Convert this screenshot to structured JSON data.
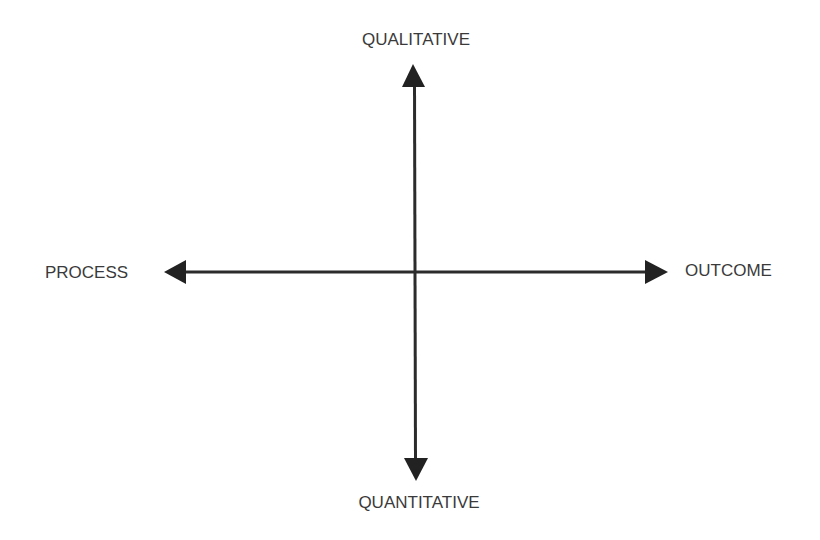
{
  "diagram": {
    "type": "quadrant-axes",
    "colors": {
      "background": "#ffffff",
      "axis": "#2b2b2b",
      "label": "#3a3a3a"
    },
    "axes": {
      "vertical": {
        "top_label": "QUALITATIVE",
        "bottom_label": "QUANTITATIVE"
      },
      "horizontal": {
        "left_label": "PROCESS",
        "right_label": "OUTCOME"
      }
    },
    "icons": {
      "up": "arrow-up-icon",
      "down": "arrow-down-icon",
      "left": "arrow-left-icon",
      "right": "arrow-right-icon"
    }
  }
}
